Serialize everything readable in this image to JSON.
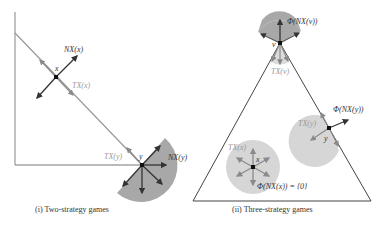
{
  "panels": [
    {
      "caption": "(i) Two-strategy games",
      "labels": {
        "x_point": "x",
        "nx_x": "NX(x)",
        "tx_x": "TX(x)",
        "y_point": "y",
        "tx_y": "TX(y)",
        "nx_y": "NX(y)"
      }
    },
    {
      "caption": "(ii) Three-strategy games",
      "labels": {
        "v_point": "v",
        "phi_nx_v": "Φ(NX(v))",
        "tx_v": "TX(v)",
        "y_point": "y",
        "tx_y": "TX(y)",
        "phi_nx_y": "Φ(NX(y))",
        "x_point": "x",
        "tx_x": "TX(x)",
        "phi_nx_x": "Φ(NX(x)) = {0}"
      }
    }
  ],
  "colors": {
    "wedge_dark": "#a8a8a8",
    "wedge_light": "#d6d6d6",
    "axis": "#888888",
    "arrow_dark": "#333333",
    "arrow_gray": "#8a8a8a"
  }
}
